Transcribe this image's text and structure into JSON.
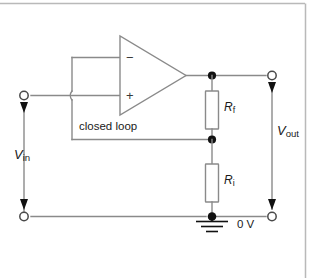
{
  "figure": {
    "kind": "schematic-diagram",
    "width": 319,
    "height": 278,
    "background_color": "#ffffff",
    "border_color": "#b9b9b9",
    "wire_color": "#8a8a8a",
    "node_color": "#111111"
  },
  "labels": {
    "closed_loop": "closed loop",
    "zero_volts": "0 V",
    "vin_symbol": "V",
    "vin_subscript": "in",
    "vout_symbol": "V",
    "vout_subscript": "out",
    "rf_symbol": "R",
    "rf_subscript": "f",
    "ri_symbol": "R",
    "ri_subscript": "i",
    "opamp_inverting": "−",
    "opamp_noninverting": "+"
  },
  "components": [
    {
      "id": "opamp",
      "name": "operational-amplifier",
      "type": "triangle",
      "inverting_input": "−",
      "noninverting_input": "+"
    },
    {
      "id": "rf",
      "name": "feedback-resistor",
      "type": "resistor",
      "label": "Rf"
    },
    {
      "id": "ri",
      "name": "input-resistor",
      "type": "resistor",
      "label": "Ri"
    },
    {
      "id": "gnd",
      "name": "ground-symbol",
      "type": "earth-ground",
      "label": "0 V"
    }
  ],
  "terminals": [
    {
      "id": "vin-top",
      "name": "vin-top-terminal",
      "label": "Vin"
    },
    {
      "id": "vin-bottom",
      "name": "vin-bottom-terminal",
      "label": "Vin"
    },
    {
      "id": "vout-top",
      "name": "vout-top-terminal",
      "label": "Vout"
    },
    {
      "id": "vout-bottom",
      "name": "vout-bottom-terminal",
      "label": "Vout"
    }
  ]
}
